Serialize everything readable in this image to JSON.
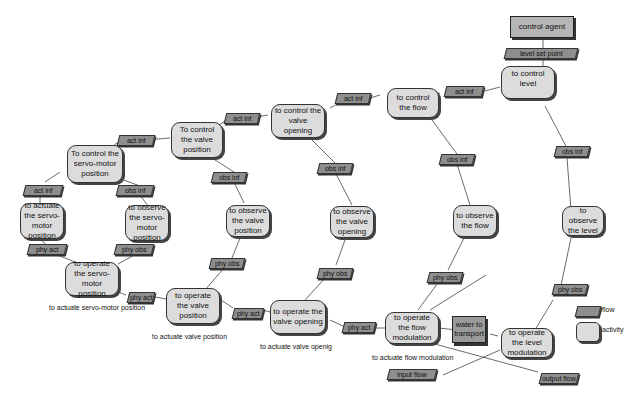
{
  "diagram": {
    "agent": "control agent",
    "activities": {
      "control_level": "to control level",
      "control_flow": "to control the flow",
      "control_valve_opening": "to control the valve opening",
      "control_valve_position": "To control the valve position",
      "control_servo": "To control the servo-motor position",
      "actuate_servo": "to actuate the servo-motor position",
      "observe_servo": "to observe the servo-motor position",
      "operate_servo": "to operate the servo-motor position",
      "observe_valve_position": "to observe the valve position",
      "operate_valve_position": "to operate the valve position",
      "observe_valve_opening": "to observe the valve opening",
      "operate_valve_opening": "to operate the valve opening",
      "observe_flow": "to observe the flow",
      "operate_flow_modulation": "to operate the flow modulation",
      "observe_level": "to observe the level",
      "operate_level_modulation": "to operate the level modulation"
    },
    "flows": {
      "level_set_point": "level set point",
      "act_inf": "act inf",
      "obs_inf": "obs inf",
      "phy_act": "phy act",
      "phy_obs": "phy obs",
      "input_flow": "input flow",
      "output_flow": "output flow"
    },
    "resource": "water to transport",
    "captions": {
      "servo": "to actuate servo-motor position",
      "valve_position": "to actuate valve position",
      "valve_opening": "to actuate valve openig",
      "flow_modulation": "to actuate flow modulation"
    },
    "legend": {
      "flow": "flow",
      "activity": "activity"
    }
  }
}
